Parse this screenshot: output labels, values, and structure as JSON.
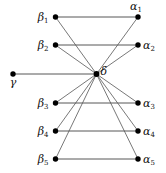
{
  "diagram": {
    "title": "",
    "nodes": [
      {
        "id": "beta1",
        "label": "β",
        "sub": "1",
        "x": 55.5,
        "y": 17,
        "label_pos": "left"
      },
      {
        "id": "beta2",
        "label": "β",
        "sub": "2",
        "x": 55.5,
        "y": 45,
        "label_pos": "left"
      },
      {
        "id": "beta3",
        "label": "β",
        "sub": "3",
        "x": 55.5,
        "y": 103,
        "label_pos": "left"
      },
      {
        "id": "beta4",
        "label": "β",
        "sub": "4",
        "x": 55.5,
        "y": 131,
        "label_pos": "left"
      },
      {
        "id": "beta5",
        "label": "β",
        "sub": "5",
        "x": 55.5,
        "y": 159,
        "label_pos": "left"
      },
      {
        "id": "alpha1",
        "label": "α",
        "sub": "1",
        "x": 138,
        "y": 17,
        "label_pos": "above"
      },
      {
        "id": "alpha2",
        "label": "α",
        "sub": "2",
        "x": 138,
        "y": 45,
        "label_pos": "right"
      },
      {
        "id": "alpha3",
        "label": "α",
        "sub": "3",
        "x": 138,
        "y": 103,
        "label_pos": "right"
      },
      {
        "id": "alpha4",
        "label": "α",
        "sub": "4",
        "x": 138,
        "y": 131,
        "label_pos": "right"
      },
      {
        "id": "alpha5",
        "label": "α",
        "sub": "5",
        "x": 138,
        "y": 159,
        "label_pos": "right"
      },
      {
        "id": "gamma",
        "label": "γ",
        "sub": "",
        "x": 13,
        "y": 74,
        "label_pos": "below"
      },
      {
        "id": "delta",
        "label": "δ",
        "sub": "",
        "x": 96.5,
        "y": 74,
        "label_pos": "right"
      }
    ],
    "edges": [
      {
        "from": "beta1",
        "to": "alpha1"
      },
      {
        "from": "beta2",
        "to": "alpha2"
      },
      {
        "from": "beta3",
        "to": "alpha3"
      },
      {
        "from": "beta4",
        "to": "alpha4"
      },
      {
        "from": "beta5",
        "to": "alpha5"
      },
      {
        "from": "gamma",
        "to": "delta"
      },
      {
        "from": "delta",
        "to": "beta1"
      },
      {
        "from": "delta",
        "to": "beta2"
      },
      {
        "from": "delta",
        "to": "beta3"
      },
      {
        "from": "delta",
        "to": "beta4"
      },
      {
        "from": "delta",
        "to": "beta5"
      },
      {
        "from": "delta",
        "to": "alpha1"
      },
      {
        "from": "delta",
        "to": "alpha2"
      },
      {
        "from": "delta",
        "to": "alpha3"
      },
      {
        "from": "delta",
        "to": "alpha4"
      },
      {
        "from": "delta",
        "to": "alpha5"
      }
    ],
    "colors": {
      "node": "#000000",
      "edge": "#555555",
      "label": "#111111",
      "background": "#ffffff"
    }
  }
}
